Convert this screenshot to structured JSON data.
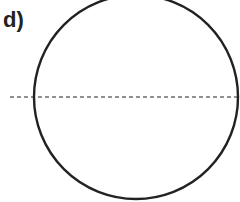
{
  "figure": {
    "label": "d)",
    "shapes": [
      {
        "kind": "circle",
        "name": "circle",
        "style": "solid"
      },
      {
        "kind": "line",
        "name": "diameter-line",
        "style": "dashed",
        "orientation": "horizontal"
      }
    ],
    "colors": {
      "stroke": "#222222",
      "background": "#ffffff"
    }
  }
}
